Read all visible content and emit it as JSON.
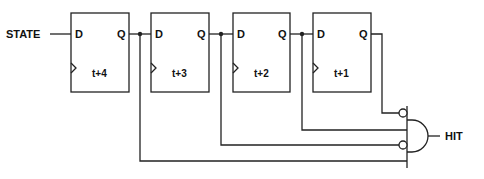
{
  "diagram": {
    "input_label": "STATE",
    "output_label": "HIT",
    "flipflops": [
      {
        "d_label": "D",
        "q_label": "Q",
        "time_label": "t+4"
      },
      {
        "d_label": "D",
        "q_label": "Q",
        "time_label": "t+3"
      },
      {
        "d_label": "D",
        "q_label": "Q",
        "time_label": "t+2"
      },
      {
        "d_label": "D",
        "q_label": "Q",
        "time_label": "t+1"
      }
    ],
    "gate": {
      "type": "AND",
      "inverted_inputs": [
        1,
        3
      ],
      "input_count": 4
    },
    "colors": {
      "line": "#222222",
      "background": "#ffffff"
    }
  }
}
